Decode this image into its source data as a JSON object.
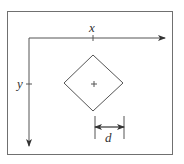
{
  "diagram": {
    "type": "coordinate-diagram",
    "labels": {
      "x_axis": "x",
      "y_axis": "y",
      "dimension": "d"
    },
    "center_marker": "+",
    "colors": {
      "line": "#555555",
      "frame": "#707070",
      "background": "#ffffff"
    },
    "elements": [
      {
        "name": "x-axis",
        "direction": "right",
        "arrow": true
      },
      {
        "name": "y-axis",
        "direction": "down",
        "arrow": true
      },
      {
        "name": "diamond-shape",
        "center_marker": "+"
      },
      {
        "name": "dimension-d",
        "description": "horizontal width marker with double-headed arrow"
      }
    ]
  }
}
